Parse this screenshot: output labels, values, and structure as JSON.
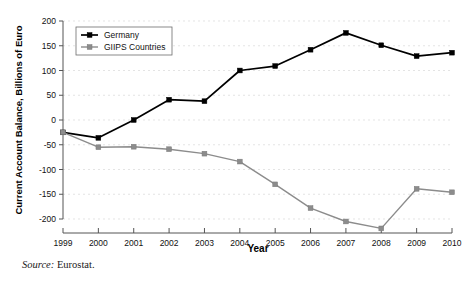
{
  "chart_data": {
    "type": "line",
    "title": "",
    "xlabel": "Year",
    "ylabel": "Current Account Balance, Billions of Euro",
    "categories": [
      "1999",
      "2000",
      "2001",
      "2002",
      "2003",
      "2004",
      "2005",
      "2006",
      "2007",
      "2008",
      "2009",
      "2010"
    ],
    "x": [
      1999,
      2000,
      2001,
      2002,
      2003,
      2004,
      2005,
      2006,
      2007,
      2008,
      2009,
      2010
    ],
    "xlim": [
      1999,
      2010
    ],
    "ylim": [
      -200,
      200
    ],
    "ytick_labels": [
      "200",
      "150",
      "100",
      "50",
      "0",
      "-50",
      "-100",
      "-150",
      "-200"
    ],
    "ytick_values": [
      200,
      150,
      100,
      50,
      0,
      -50,
      -100,
      -150,
      -200
    ],
    "grid": true,
    "legend_position": "top-left",
    "series": [
      {
        "name": "Germany",
        "color": "#000000",
        "marker": "square",
        "values": [
          -25,
          -36,
          0,
          41,
          38,
          100,
          109,
          142,
          176,
          151,
          129,
          136
        ]
      },
      {
        "name": "GIIPS Countries",
        "color": "#8c8c8c",
        "marker": "square",
        "values": [
          -25,
          -55,
          -54,
          -59,
          -68,
          -84,
          -130,
          -178,
          -205,
          -219,
          -139,
          -146
        ]
      }
    ]
  },
  "legend": {
    "entries": [
      {
        "label": "Germany"
      },
      {
        "label": "GIIPS Countries"
      }
    ]
  },
  "caption": {
    "source_word": "Source:",
    "source_value": "Eurostat."
  },
  "colors": {
    "germany": "#000000",
    "giips": "#8c8c8c",
    "grid": "#d8d8d8",
    "axis": "#555555",
    "background": "#ffffff"
  }
}
